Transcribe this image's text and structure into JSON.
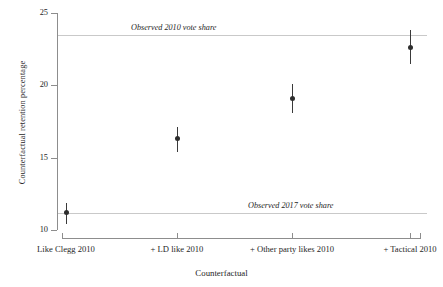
{
  "chart_data": {
    "type": "scatter",
    "title": "",
    "xlabel": "Counterfactual",
    "ylabel": "Counterfactual retention percentage",
    "categories": [
      "Like Clegg 2010",
      "+ LD like 2010",
      "+ Other party likes 2010",
      "+ Tactical 2010"
    ],
    "values": [
      11.2,
      16.3,
      19.1,
      22.6
    ],
    "error_low": [
      10.4,
      15.4,
      18.1,
      21.5
    ],
    "error_high": [
      11.9,
      17.1,
      20.1,
      23.8
    ],
    "ylim": [
      10,
      25
    ],
    "yticks": [
      10,
      15,
      20,
      25
    ],
    "ytick_labels": [
      "10",
      "15",
      "20",
      "25"
    ],
    "grid": false,
    "legend": "none",
    "reference_lines": [
      {
        "label": "Observed 2010 vote share",
        "value": 23.5
      },
      {
        "label": "Observed 2017 vote share",
        "value": 11.2
      }
    ],
    "colors": {
      "point": "#2e2e2e",
      "error_bar": "#3a3a3a",
      "reference_line": "#c9c9c9",
      "axis": "#8d8d8d",
      "background": "#ffffff"
    }
  }
}
